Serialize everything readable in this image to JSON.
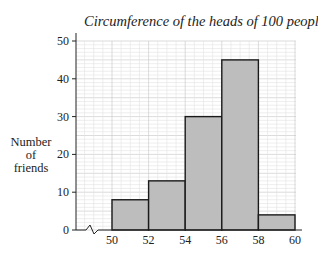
{
  "chart_data": {
    "type": "bar",
    "subtype": "histogram",
    "title": "Circumference of the heads of 100 people",
    "xlabel": "",
    "ylabel": "Number of friends",
    "ylabel_lines": [
      "Number",
      "of",
      "friends"
    ],
    "bins": [
      {
        "from": 50,
        "to": 52,
        "value": 8
      },
      {
        "from": 52,
        "to": 54,
        "value": 13
      },
      {
        "from": 54,
        "to": 56,
        "value": 30
      },
      {
        "from": 56,
        "to": 58,
        "value": 45
      },
      {
        "from": 58,
        "to": 60,
        "value": 4
      }
    ],
    "categories": [
      "50-52",
      "52-54",
      "54-56",
      "56-58",
      "58-60"
    ],
    "values": [
      8,
      13,
      30,
      45,
      4
    ],
    "x_ticks": [
      "50",
      "52",
      "54",
      "56",
      "58",
      "60"
    ],
    "y_ticks": [
      "0",
      "10",
      "20",
      "30",
      "40",
      "50"
    ],
    "ylim": [
      0,
      50
    ],
    "xlim": [
      50,
      60
    ],
    "x_axis_break": true,
    "grid": true,
    "bar_color": "#bdbdbd",
    "grid_color": "#d0d0d0"
  }
}
